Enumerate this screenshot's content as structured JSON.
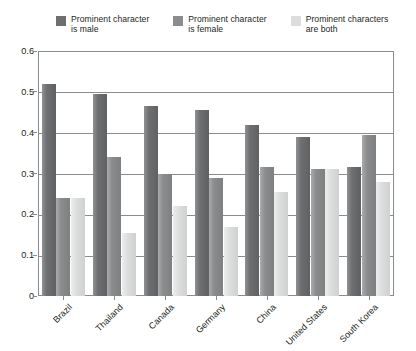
{
  "chart_data": {
    "type": "bar",
    "title": "",
    "subtitle": "",
    "xlabel": "",
    "ylabel": "",
    "grid": true,
    "legend_position": "top",
    "categories": [
      "Brazil",
      "Thailand",
      "Canada",
      "Germany",
      "China",
      "United States",
      "South Korea"
    ],
    "ylim": [
      0,
      0.6
    ],
    "ytick_labels": [
      "0.6",
      "0.5",
      "0.4",
      "0.3",
      "0.2",
      "0.1",
      "0"
    ],
    "ytick_values": [
      0.6,
      0.5,
      0.4,
      0.3,
      0.2,
      0.1,
      0
    ],
    "series": [
      {
        "name": "Prominent character is male",
        "color": "#6d6f71",
        "values": [
          0.52,
          0.495,
          0.465,
          0.455,
          0.42,
          0.39,
          0.315
        ]
      },
      {
        "name": "Prominent character is female",
        "color": "#8a8c8e",
        "values": [
          0.24,
          0.34,
          0.3,
          0.29,
          0.315,
          0.31,
          0.395
        ]
      },
      {
        "name": "Prominent characters are both",
        "color": "#dcdddd",
        "values": [
          0.24,
          0.155,
          0.22,
          0.17,
          0.255,
          0.31,
          0.28
        ]
      }
    ]
  },
  "legend": {
    "items": [
      {
        "label": "Prominent character\nis male",
        "swatch": "#6d6f71"
      },
      {
        "label": "Prominent character\nis female",
        "swatch": "#8a8c8e"
      },
      {
        "label": "Prominent characters\nare both",
        "swatch": "#dcdddd"
      }
    ]
  },
  "colors": {
    "axis": "#8a8d8f",
    "text": "#231f20",
    "background": "#ffffff"
  }
}
